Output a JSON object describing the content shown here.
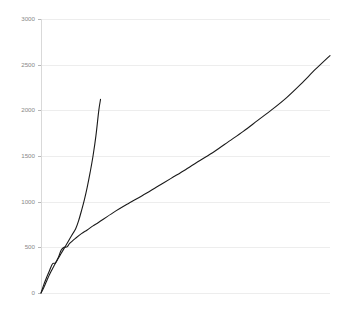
{
  "chart_data": {
    "type": "line",
    "title": "",
    "subtitle": "",
    "xlabel": "",
    "ylabel": "",
    "grid": true,
    "legend": false,
    "legend_position": "none",
    "xlim": [
      0,
      100
    ],
    "ylim": [
      0,
      3000
    ],
    "x_tick_labels": [],
    "y_tick_labels": [
      "0",
      "500",
      "1000",
      "1500",
      "2000",
      "2500",
      "3000"
    ],
    "y_ticks": [
      0,
      500,
      1000,
      1500,
      2000,
      2500,
      3000
    ],
    "colors": {
      "line": "#1a1a1a",
      "grid": "#ededed",
      "axis": "#d9d9d9",
      "tick_text": "#888888",
      "background": "#ffffff"
    },
    "series": [
      {
        "name": "steep",
        "color": "#1a1a1a",
        "x": [
          0,
          0.6,
          1.2,
          1.8,
          2.4,
          3.0,
          3.6,
          4.2,
          4.8,
          5.4,
          6.0,
          6.8,
          7.6,
          8.4,
          9.2,
          10.0,
          11.0,
          12.0,
          13.0,
          14.0,
          15.0,
          16.0,
          17.0,
          18.0,
          19.0,
          20.0,
          20.6
        ],
        "values": [
          0,
          36,
          76,
          120,
          164,
          205,
          243,
          279,
          314,
          348,
          381,
          424,
          467,
          510,
          553,
          596,
          650,
          704,
          790,
          900,
          1020,
          1160,
          1320,
          1500,
          1720,
          2000,
          2120
        ]
      },
      {
        "name": "wavy",
        "color": "#1a1a1a",
        "x": [
          0,
          1,
          2,
          3,
          4,
          5,
          6,
          7,
          8,
          9,
          10,
          12,
          14,
          16,
          18,
          20,
          25,
          30,
          35,
          40,
          45,
          50,
          55,
          60,
          65,
          70,
          75,
          80,
          85,
          90,
          95,
          100
        ],
        "values": [
          0,
          95,
          175,
          250,
          320,
          330,
          390,
          470,
          500,
          505,
          545,
          600,
          650,
          690,
          735,
          775,
          880,
          975,
          1065,
          1160,
          1255,
          1350,
          1450,
          1550,
          1660,
          1770,
          1890,
          2010,
          2140,
          2290,
          2450,
          2600
        ]
      }
    ]
  },
  "axes": {
    "plot_left_px": 41,
    "plot_right_px": 330,
    "plot_top_px": 19,
    "plot_bottom_px": 293
  }
}
